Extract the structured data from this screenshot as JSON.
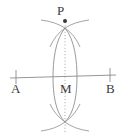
{
  "figure": {
    "background_color": "#ffffff",
    "stroke_color": "#8a8a8a",
    "label_color": "#3a3a3a",
    "labels": {
      "point_p": "P",
      "point_a": "A",
      "point_b": "B",
      "point_m": "M"
    },
    "elements": {
      "baseline_name": "line-AB",
      "baseline": {
        "x1": 10,
        "y1": 78,
        "x2": 116,
        "y2": 75
      },
      "tick_a": {
        "x": 16,
        "y": 77,
        "half_height": 7
      },
      "tick_b": {
        "x": 110,
        "y": 75,
        "half_height": 7
      },
      "midpoint_m": {
        "x": 65,
        "y": 77
      },
      "point_p_marker": {
        "x": 65,
        "y": 21,
        "radius": 2
      },
      "perpendicular_dotted": {
        "x": 65,
        "y1": 19,
        "y2": 134
      },
      "arc_left_center": {
        "x": 39,
        "y": 77,
        "radius": 39
      },
      "arc_right_center": {
        "x": 91,
        "y": 77,
        "radius": 39
      },
      "lens_left_x": 53,
      "lens_right_x": 77,
      "lens_top_y": 40,
      "lens_bottom_y": 114,
      "arc_cross_top": {
        "x": 65,
        "y": 28
      },
      "arc_cross_bottom": {
        "x": 65,
        "y": 122
      }
    }
  }
}
